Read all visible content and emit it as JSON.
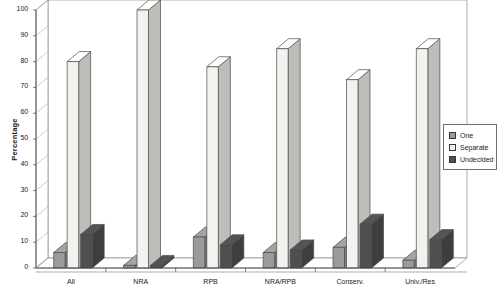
{
  "chart_data": {
    "type": "bar",
    "title": "",
    "subtitle": "",
    "xlabel": "",
    "ylabel": "Percentage",
    "ylim": [
      0,
      100
    ],
    "yticks": [
      0,
      10,
      20,
      30,
      40,
      50,
      60,
      70,
      80,
      90,
      100
    ],
    "categories": [
      "All",
      "NRA",
      "RPB",
      "NRA/RPB",
      "Conserv.",
      "Univ./Res"
    ],
    "grid": false,
    "legend_position": "right",
    "three_d": true,
    "series": [
      {
        "name": "One",
        "color": "#9a9a9a",
        "values": [
          6,
          1,
          12,
          6,
          8,
          3
        ]
      },
      {
        "name": "Separate",
        "color": "#f2f2ef",
        "values": [
          80,
          100,
          78,
          85,
          73,
          85
        ]
      },
      {
        "name": "Undecided",
        "color": "#4f4f4f",
        "values": [
          13,
          1,
          9,
          7,
          17,
          11
        ]
      }
    ]
  },
  "legend": {
    "items": [
      {
        "label": "One"
      },
      {
        "label": "Separate"
      },
      {
        "label": "Undecided"
      }
    ]
  },
  "axes": {
    "y_title": "Percentage"
  }
}
